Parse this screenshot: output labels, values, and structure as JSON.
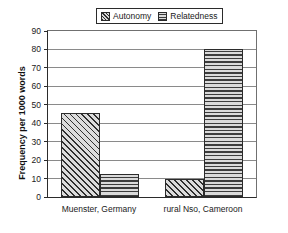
{
  "chart_data": {
    "type": "bar",
    "title": "",
    "subtitle": "",
    "xlabel": "",
    "ylabel": "Frequency per 1000 words",
    "ylim": [
      0,
      90
    ],
    "yticks": [
      0,
      10,
      20,
      30,
      40,
      50,
      60,
      70,
      80,
      90
    ],
    "ytick_labels": [
      "0",
      "10",
      "20",
      "30",
      "40",
      "50",
      "60",
      "70",
      "80",
      "90"
    ],
    "grid": "horizontal",
    "legend_position": "top-center",
    "categories": [
      "Muenster, Germany",
      "rural Nso, Cameroon"
    ],
    "series": [
      {
        "name": "Autonomy",
        "pattern": "diagonal-hatch",
        "values": [
          45.5,
          9.5
        ]
      },
      {
        "name": "Relatedness",
        "pattern": "horizontal-hatch",
        "values": [
          12.5,
          80.0
        ]
      }
    ]
  },
  "legend": {
    "entries": [
      {
        "label": "Autonomy",
        "swatch": "diagonal-hatch-swatch-icon"
      },
      {
        "label": "Relatedness",
        "swatch": "horizontal-hatch-swatch-icon"
      }
    ]
  },
  "colors": {
    "axis": "#2b2b2b",
    "gridline": "#8a8a8a",
    "hatch_dark": "#2f2f2f",
    "fill_light": "#d9d9d9",
    "background": "#ffffff",
    "text": "#1a1a1a"
  }
}
